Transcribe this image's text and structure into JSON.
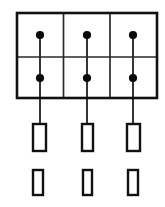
{
  "diagram": {
    "type": "schematic-line-diagram",
    "canvas": {
      "width": 165,
      "height": 207,
      "background": "#ffffff"
    },
    "colors": {
      "outline": "#111111",
      "inner_line": "#2a2a2a",
      "lead_line": "#2b2b2b",
      "dot_fill": "#0b0b0b",
      "rect_fill": "#ffffff"
    },
    "grid": {
      "label": "grid-frame",
      "columns": 3,
      "rows": 2,
      "left": 17,
      "top": 13,
      "right": 157,
      "bottom": 98,
      "column_dividers_x": [
        63.5,
        110
      ],
      "row_divider_y": 57,
      "outer_stroke_width": 2.6,
      "inner_stroke_width": 1.7
    },
    "columns": [
      {
        "name": "column-1",
        "center_x": 40,
        "dots": [
          {
            "name": "dot-top",
            "cx": 40,
            "cy": 35,
            "r": 4.1
          },
          {
            "name": "dot-bottom",
            "cx": 40,
            "cy": 78,
            "r": 4.1
          }
        ],
        "lead_line": {
          "x": 40,
          "y_start": 35,
          "y_end": 124
        },
        "tall_rect": {
          "name": "element-tall",
          "x": 33,
          "y": 124,
          "width": 13,
          "height": 27
        },
        "short_rect": {
          "name": "element-short",
          "x": 33,
          "y": 170,
          "width": 10,
          "height": 25
        }
      },
      {
        "name": "column-2",
        "center_x": 87,
        "dots": [
          {
            "name": "dot-top",
            "cx": 87,
            "cy": 35,
            "r": 4.1
          },
          {
            "name": "dot-bottom",
            "cx": 87,
            "cy": 78,
            "r": 4.1
          }
        ],
        "lead_line": {
          "x": 87,
          "y_start": 35,
          "y_end": 124
        },
        "tall_rect": {
          "name": "element-tall",
          "x": 82,
          "y": 124,
          "width": 11,
          "height": 27
        },
        "short_rect": {
          "name": "element-short",
          "x": 83,
          "y": 170,
          "width": 9,
          "height": 25
        }
      },
      {
        "name": "column-3",
        "center_x": 133,
        "dots": [
          {
            "name": "dot-top",
            "cx": 133,
            "cy": 35,
            "r": 4.1
          },
          {
            "name": "dot-bottom",
            "cx": 133,
            "cy": 78,
            "r": 4.1
          }
        ],
        "lead_line": {
          "x": 133,
          "y_start": 35,
          "y_end": 124
        },
        "tall_rect": {
          "name": "element-tall",
          "x": 127,
          "y": 124,
          "width": 13,
          "height": 27
        },
        "short_rect": {
          "name": "element-short",
          "x": 128,
          "y": 170,
          "width": 10,
          "height": 25
        }
      }
    ],
    "counts": {
      "dots_total": 6,
      "tall_rects_total": 3,
      "short_rects_total": 3,
      "lead_lines_total": 3
    },
    "labels": []
  }
}
